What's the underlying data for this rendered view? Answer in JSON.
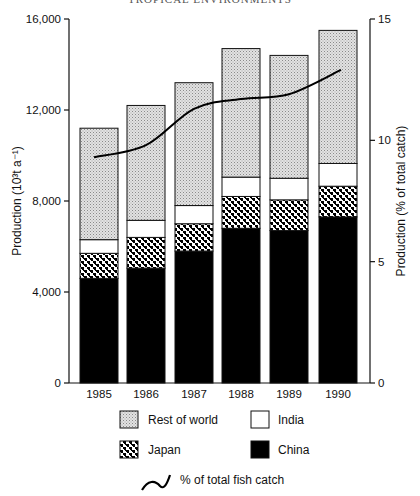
{
  "header": "TROPICAL ENVIRONMENTS",
  "chart_data": {
    "type": "bar",
    "subtype": "stacked bar with line overlay (dual axis)",
    "title": "",
    "categories": [
      "1985",
      "1986",
      "1987",
      "1988",
      "1989",
      "1990"
    ],
    "series": [
      {
        "name": "China",
        "axis": "left",
        "values": [
          4600,
          5050,
          5800,
          6800,
          6700,
          7300
        ],
        "fill": "#000000"
      },
      {
        "name": "Japan",
        "axis": "left",
        "values": [
          1100,
          1350,
          1200,
          1400,
          1350,
          1350
        ],
        "fill": "pattern-checker"
      },
      {
        "name": "India",
        "axis": "left",
        "values": [
          600,
          750,
          800,
          850,
          950,
          1000
        ],
        "fill": "#ffffff"
      },
      {
        "name": "Rest of world",
        "axis": "left",
        "values": [
          4900,
          5050,
          5400,
          5650,
          5400,
          5850
        ],
        "fill": "pattern-stipple"
      }
    ],
    "totals": [
      11200,
      12200,
      13200,
      14700,
      14400,
      15500
    ],
    "line_series": {
      "name": "% of total fish catch",
      "axis": "right",
      "values": [
        9.3,
        9.8,
        11.3,
        11.7,
        11.9,
        12.9
      ]
    },
    "xlabel": "",
    "ylabel": "Production (10³t a⁻¹)",
    "ylabel_right": "Production (% of total catch)",
    "ylim": [
      0,
      16000
    ],
    "ylim_right": [
      0,
      15
    ],
    "yticks": [
      0,
      4000,
      8000,
      12000,
      16000
    ],
    "ytick_labels": [
      "0",
      "4,000",
      "8,000",
      "12,000",
      "16,000"
    ],
    "yticks_right": [
      0,
      5,
      10,
      15
    ],
    "ytick_labels_right": [
      "0",
      "5",
      "10",
      "15"
    ],
    "grid": false,
    "legend_position": "bottom"
  },
  "legend": {
    "rest_of_world": "Rest of world",
    "india": "India",
    "japan": "Japan",
    "china": "China",
    "line": "% of total fish catch"
  }
}
